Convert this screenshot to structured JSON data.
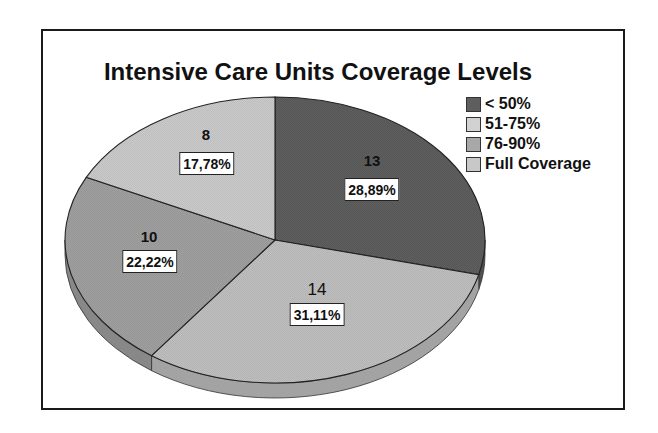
{
  "chart_data": {
    "type": "pie",
    "style": "3d",
    "title": "Intensive Care Units Coverage Levels",
    "categories": [
      "< 50%",
      "51-75%",
      "76-90%",
      "Full Coverage"
    ],
    "values": [
      13,
      14,
      10,
      8
    ],
    "percent_labels": [
      "28,89%",
      "31,11%",
      "22,22%",
      "17,78%"
    ],
    "percentages": [
      28.89,
      31.11,
      22.22,
      17.78
    ],
    "colors": [
      "#5e5e5e",
      "#c0c0c0",
      "#a0a0a0",
      "#cbcbcb"
    ],
    "legend_position": "right",
    "start_angle": "12 o'clock",
    "direction": "clockwise"
  },
  "legend": {
    "items": [
      {
        "label": "< 50%",
        "color": "#5e5e5e"
      },
      {
        "label": "51-75%",
        "color": "#d2d2d2"
      },
      {
        "label": "76-90%",
        "color": "#a8a8a8"
      },
      {
        "label": "Full Coverage",
        "color": "#c8c8c8"
      }
    ]
  },
  "labels": [
    {
      "value": "13",
      "pct": "28,89%"
    },
    {
      "value": "14",
      "pct": "31,11%"
    },
    {
      "value": "10",
      "pct": "22,22%"
    },
    {
      "value": "8",
      "pct": "17,78%"
    }
  ]
}
